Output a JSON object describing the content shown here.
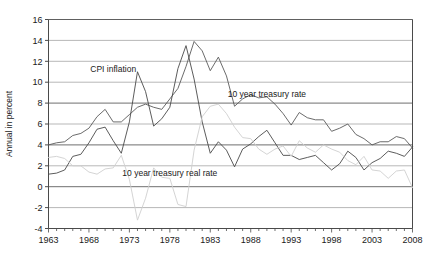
{
  "chart_data": {
    "type": "line",
    "title": "",
    "xlabel": "",
    "ylabel": "Annual in percent",
    "xlim": [
      1963,
      2008
    ],
    "ylim": [
      -4,
      16
    ],
    "ytick_values": [
      -4,
      -2,
      0,
      2,
      4,
      6,
      8,
      10,
      12,
      14,
      16
    ],
    "ytick_labels": [
      "-4",
      "-2",
      "0",
      "2",
      "4",
      "6",
      "8",
      "10",
      "12",
      "14",
      "16"
    ],
    "xtick_values": [
      1963,
      1968,
      1973,
      1978,
      1983,
      1988,
      1993,
      1998,
      2003,
      2008
    ],
    "xtick_labels": [
      "1963",
      "1968",
      "1973",
      "1978",
      "1983",
      "1988",
      "1993",
      "1998",
      "2003",
      "2008"
    ],
    "minor_xtick_step": 1,
    "grid": "horizontal",
    "legend": "inline-annotations",
    "x": [
      1963,
      1964,
      1965,
      1966,
      1967,
      1968,
      1969,
      1970,
      1971,
      1972,
      1973,
      1974,
      1975,
      1976,
      1977,
      1978,
      1979,
      1980,
      1981,
      1982,
      1983,
      1984,
      1985,
      1986,
      1987,
      1988,
      1989,
      1990,
      1991,
      1992,
      1993,
      1994,
      1995,
      1996,
      1997,
      1998,
      1999,
      2000,
      2001,
      2002,
      2003,
      2004,
      2005,
      2006,
      2007,
      2008
    ],
    "series": [
      {
        "name": "10 year treasury rate",
        "color": "#5a5a5a",
        "annotation": "10 year treasury rate",
        "annotation_x": 1990,
        "annotation_y": 8.6,
        "values": [
          4.0,
          4.2,
          4.3,
          4.9,
          5.1,
          5.6,
          6.7,
          7.4,
          6.2,
          6.2,
          6.9,
          7.6,
          7.9,
          7.6,
          7.4,
          8.4,
          9.4,
          11.5,
          13.9,
          13.0,
          11.1,
          12.4,
          10.6,
          7.7,
          8.4,
          8.8,
          8.5,
          8.6,
          7.9,
          7.0,
          5.9,
          7.1,
          6.6,
          6.4,
          6.4,
          5.3,
          5.6,
          6.0,
          5.0,
          4.6,
          4.0,
          4.3,
          4.3,
          4.8,
          4.6,
          3.7
        ]
      },
      {
        "name": "CPI inflation",
        "color": "#4a4a4a",
        "annotation": "CPI  inflation",
        "annotation_x": 1971,
        "annotation_y": 11.0,
        "values": [
          1.2,
          1.3,
          1.6,
          2.9,
          3.1,
          4.2,
          5.5,
          5.7,
          4.4,
          3.2,
          6.2,
          11.0,
          9.1,
          5.8,
          6.5,
          7.6,
          11.3,
          13.5,
          10.3,
          6.2,
          3.2,
          4.3,
          3.5,
          1.9,
          3.6,
          4.1,
          4.8,
          5.4,
          4.2,
          3.0,
          3.0,
          2.6,
          2.8,
          3.0,
          2.3,
          1.6,
          2.2,
          3.4,
          2.8,
          1.6,
          2.3,
          2.7,
          3.4,
          3.2,
          2.9,
          3.8
        ]
      },
      {
        "name": "10 year treasury real rate",
        "color": "#cfcfcf",
        "annotation": "10 year treasury real rate",
        "annotation_x": 1978,
        "annotation_y": 1.0,
        "values": [
          2.8,
          2.9,
          2.7,
          2.0,
          2.0,
          1.4,
          1.2,
          1.7,
          1.8,
          3.0,
          0.7,
          -3.2,
          -1.1,
          1.8,
          0.9,
          0.8,
          -1.7,
          -1.9,
          3.5,
          6.7,
          7.7,
          7.9,
          7.0,
          5.7,
          4.7,
          4.6,
          3.6,
          3.1,
          3.6,
          3.9,
          2.9,
          4.4,
          3.7,
          3.3,
          4.0,
          3.6,
          3.3,
          2.5,
          2.1,
          2.9,
          1.6,
          1.5,
          0.8,
          1.5,
          1.6,
          -0.1
        ]
      }
    ]
  },
  "axis": {
    "y_title": "Annual in percent"
  }
}
